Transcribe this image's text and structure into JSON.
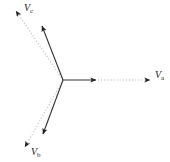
{
  "figure": {
    "background_color": "#ffffff",
    "width": 170,
    "height": 162
  },
  "chart_data": {
    "type": "scatter",
    "subtype": "phasor-diagram",
    "title": "",
    "xlabel": "",
    "ylabel": "",
    "grid": false,
    "legend": "none",
    "origin": {
      "x": 63,
      "y": 80
    },
    "axis_ranges": {
      "xlim": [
        0,
        170
      ],
      "ylim": [
        0,
        162
      ]
    },
    "series": [
      {
        "name": "Va",
        "label_text": "V",
        "label_subscript": "a",
        "angle_deg": 0,
        "solid_length_px": 33,
        "dotted_length_px": 87,
        "solid_color": "#333333",
        "dotted_color": "#a8a8a8",
        "solid_tip": {
          "x": 96,
          "y": 80
        },
        "dotted_tip": {
          "x": 150,
          "y": 80
        },
        "label_position": {
          "x": 155,
          "y": 70
        }
      },
      {
        "name": "Vb",
        "label_text": "V",
        "label_subscript": "b",
        "angle_deg": -112,
        "solid_length_px": 58,
        "dotted_length_px": 85,
        "solid_color": "#333333",
        "dotted_color": "#a8a8a8",
        "solid_tip": {
          "x": 43,
          "y": 134
        },
        "dotted_tip": {
          "x": 25,
          "y": 147
        },
        "label_position": {
          "x": 31,
          "y": 147
        }
      },
      {
        "name": "Vc",
        "label_text": "V",
        "label_subscript": "c",
        "angle_deg": 112,
        "solid_length_px": 62,
        "dotted_length_px": 87,
        "solid_color": "#333333",
        "dotted_color": "#a8a8a8",
        "solid_tip": {
          "x": 42,
          "y": 26
        },
        "dotted_tip": {
          "x": 16,
          "y": 11
        },
        "label_position": {
          "x": 24,
          "y": 3
        }
      }
    ],
    "annotations": [
      {
        "text": "Va",
        "description": "phase A voltage phasor label"
      },
      {
        "text": "Vb",
        "description": "phase B voltage phasor label"
      },
      {
        "text": "Vc",
        "description": "phase C voltage phasor label"
      }
    ]
  },
  "labels": {
    "va": {
      "base": "V",
      "sub": "a"
    },
    "vb": {
      "base": "V",
      "sub": "b"
    },
    "vc": {
      "base": "V",
      "sub": "c"
    }
  }
}
